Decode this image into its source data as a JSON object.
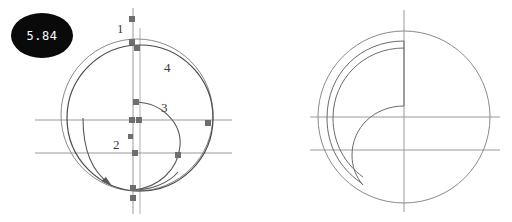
{
  "page": {
    "width": 512,
    "height": 222,
    "background": "#ffffff",
    "figure_count": 2
  },
  "colors": {
    "badge_fill": "#0a0a0a",
    "badge_text": "#ffffff",
    "stroke_light": "#8a8a8a",
    "stroke_dark": "#4a4a4a",
    "marker_fill": "#6e6e6e",
    "axis_line": "#9a9a9a"
  },
  "figures": [
    {
      "id": "figure-left",
      "badge": "5.84",
      "description": "Circle with inner spiral arc, construction axes and square markers",
      "labels": [
        {
          "text": "1",
          "x": 121,
          "y": 29
        },
        {
          "text": "4",
          "x": 168,
          "y": 68
        },
        {
          "text": "3",
          "x": 165,
          "y": 108
        },
        {
          "text": "2",
          "x": 117,
          "y": 145
        }
      ],
      "markers": [
        {
          "x": 132,
          "y": 19
        },
        {
          "x": 132,
          "y": 42
        },
        {
          "x": 137,
          "y": 48
        },
        {
          "x": 136,
          "y": 102
        },
        {
          "x": 132,
          "y": 120
        },
        {
          "x": 139,
          "y": 120
        },
        {
          "x": 208,
          "y": 123
        },
        {
          "x": 130,
          "y": 137
        },
        {
          "x": 135,
          "y": 153
        },
        {
          "x": 178,
          "y": 155
        },
        {
          "x": 133,
          "y": 188
        },
        {
          "x": 133,
          "y": 198
        }
      ],
      "axes": {
        "vertical_lines_x": [
          133,
          140
        ],
        "horizontal_lines_y": [
          120,
          153
        ]
      },
      "circle": {
        "cx": 137,
        "cy": 115,
        "r": 76
      },
      "arrow": {
        "tip_x": 112,
        "tip_y": 186,
        "direction": "counter-clockwise"
      }
    },
    {
      "id": "figure-right",
      "badge": "5.85",
      "description": "Circle with inner comma / crescent shape and construction axes",
      "labels": [],
      "markers": [],
      "axes": {
        "vertical_lines_x": [
          404
        ],
        "horizontal_lines_y": [
          117,
          150
        ]
      },
      "circle": {
        "cx": 404,
        "cy": 117,
        "r": 86
      }
    }
  ]
}
